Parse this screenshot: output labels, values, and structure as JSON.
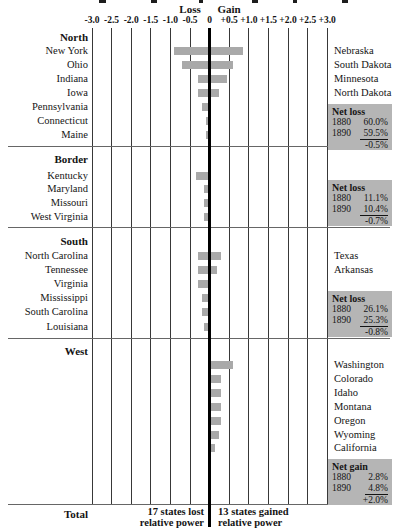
{
  "page": {
    "loss_header": "Loss",
    "gain_header": "Gain",
    "total_label": "Total",
    "lost_note": [
      "17 states lost",
      "relative power"
    ],
    "gained_note": [
      "13 states gained",
      "relative power"
    ]
  },
  "axis": {
    "ticks": [
      "-3.0",
      "-2.5",
      "-2.0",
      "-1.5",
      "-1.0",
      "-0.5",
      "0",
      "+0.5",
      "+1.0",
      "+1.5",
      "+2.0",
      "+2.5",
      "+3.0"
    ]
  },
  "colors": {
    "bar_fill": "#a9a9a9",
    "net_box_bg": "#b5b5b5",
    "zero_line": "#000000",
    "grid_line": "#383838"
  },
  "chart_data": {
    "type": "bar",
    "orientation": "horizontal-diverging",
    "title": "",
    "xlim": [
      -3.0,
      3.0
    ],
    "tick_interval": 0.5,
    "grid": true,
    "left_column_meaning": "states that lost relative power",
    "right_column_meaning": "states that gained relative power",
    "sections": [
      {
        "name": "North",
        "rows": [
          {
            "loss_state": "New York",
            "loss": 0.9,
            "gain_state": "Nebraska",
            "gain": 0.85
          },
          {
            "loss_state": "Ohio",
            "loss": 0.7,
            "gain_state": "South Dakota",
            "gain": 0.6
          },
          {
            "loss_state": "Indiana",
            "loss": 0.3,
            "gain_state": "Minnesota",
            "gain": 0.45
          },
          {
            "loss_state": "Iowa",
            "loss": 0.3,
            "gain_state": "North Dakota",
            "gain": 0.25
          },
          {
            "loss_state": "Pennsylvania",
            "loss": 0.2,
            "gain_state": "",
            "gain": 0
          },
          {
            "loss_state": "Connecticut",
            "loss": 0.1,
            "gain_state": "",
            "gain": 0
          },
          {
            "loss_state": "Maine",
            "loss": 0.1,
            "gain_state": "",
            "gain": 0
          }
        ],
        "net_box": {
          "title": "Net loss",
          "rows": [
            [
              "1880",
              "60.0%"
            ],
            [
              "1890",
              "59.5%"
            ]
          ],
          "result": "-0.5%"
        }
      },
      {
        "name": "Border",
        "rows": [
          {
            "loss_state": "Kentucky",
            "loss": 0.35,
            "gain_state": "",
            "gain": 0
          },
          {
            "loss_state": "Maryland",
            "loss": 0.15,
            "gain_state": "",
            "gain": 0
          },
          {
            "loss_state": "Missouri",
            "loss": 0.15,
            "gain_state": "",
            "gain": 0
          },
          {
            "loss_state": "West Virginia",
            "loss": 0.15,
            "gain_state": "",
            "gain": 0
          }
        ],
        "net_box": {
          "title": "Net loss",
          "rows": [
            [
              "1880",
              "11.1%"
            ],
            [
              "1890",
              "10.4%"
            ]
          ],
          "result": "-0.7%"
        }
      },
      {
        "name": "South",
        "rows": [
          {
            "loss_state": "North Carolina",
            "loss": 0.3,
            "gain_state": "Texas",
            "gain": 0.3
          },
          {
            "loss_state": "Tennessee",
            "loss": 0.3,
            "gain_state": "Arkansas",
            "gain": 0.2
          },
          {
            "loss_state": "Virginia",
            "loss": 0.3,
            "gain_state": "",
            "gain": 0
          },
          {
            "loss_state": "Mississippi",
            "loss": 0.2,
            "gain_state": "",
            "gain": 0
          },
          {
            "loss_state": "South Carolina",
            "loss": 0.2,
            "gain_state": "",
            "gain": 0
          },
          {
            "loss_state": "Louisiana",
            "loss": 0.15,
            "gain_state": "",
            "gain": 0
          }
        ],
        "net_box": {
          "title": "Net loss",
          "rows": [
            [
              "1880",
              "26.1%"
            ],
            [
              "1890",
              "25.3%"
            ]
          ],
          "result": "-0.8%"
        }
      },
      {
        "name": "West",
        "rows": [
          {
            "loss_state": "",
            "loss": 0,
            "gain_state": "Washington",
            "gain": 0.6
          },
          {
            "loss_state": "",
            "loss": 0,
            "gain_state": "Colorado",
            "gain": 0.3
          },
          {
            "loss_state": "",
            "loss": 0,
            "gain_state": "Idaho",
            "gain": 0.3
          },
          {
            "loss_state": "",
            "loss": 0,
            "gain_state": "Montana",
            "gain": 0.3
          },
          {
            "loss_state": "",
            "loss": 0,
            "gain_state": "Oregon",
            "gain": 0.3
          },
          {
            "loss_state": "",
            "loss": 0,
            "gain_state": "Wyoming",
            "gain": 0.25
          },
          {
            "loss_state": "",
            "loss": 0,
            "gain_state": "California",
            "gain": 0.15
          }
        ],
        "net_box": {
          "title": "Net gain",
          "rows": [
            [
              "1880",
              "2.8%"
            ],
            [
              "1890",
              "4.8%"
            ]
          ],
          "result": "+2.0%"
        }
      }
    ]
  }
}
